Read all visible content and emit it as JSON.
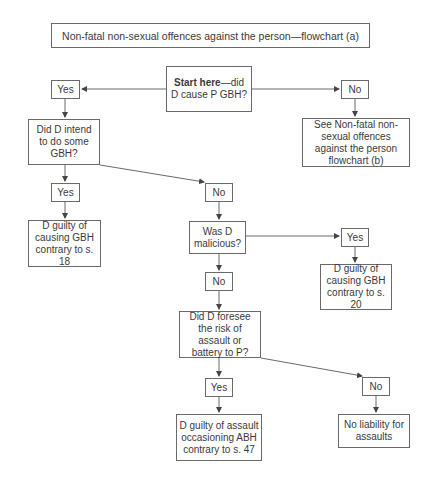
{
  "title": "Non-fatal non-sexual offences against the person—flowchart (a)",
  "nodes": {
    "start": {
      "bold": "Start here",
      "rest": "—did D cause P GBH?"
    },
    "yes1": "Yes",
    "no1": "No",
    "intend": "Did D intend to do some GBH?",
    "see_b": "See Non-fatal non-sexual offences against the person flowchart (b)",
    "yes2": "Yes",
    "no2": "No",
    "s18": "D guilty of causing GBH contrary to s. 18",
    "malicious": "Was D malicious?",
    "yes3": "Yes",
    "s20": "D guilty of causing GBH contrary to s. 20",
    "no3": "No",
    "foresee": "Did D foresee the risk of assault or battery to P?",
    "yes4": "Yes",
    "no4": "No",
    "s47": "D guilty of assault occasioning ABH contrary to s. 47",
    "no_liability": "No liability for assaults"
  },
  "colors": {
    "stroke": "#6a6a6a",
    "text": "#3a3a3a"
  }
}
